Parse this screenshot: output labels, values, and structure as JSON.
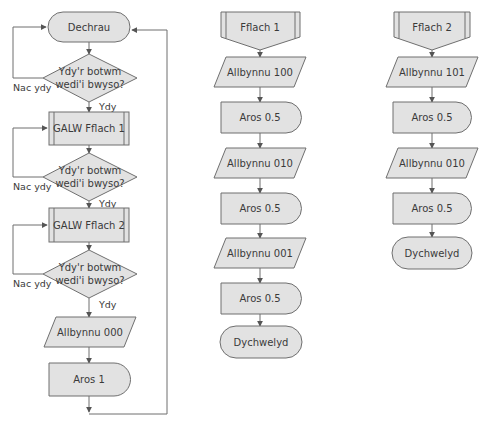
{
  "diagram": {
    "type": "flowchart",
    "colors": {
      "fill": "#e2e2e2",
      "stroke": "#6f6f6f",
      "text": "#3a3a3a"
    },
    "main": {
      "start": "Dechrau",
      "decision1": {
        "line1": "Ydy'r botwm",
        "line2": "wedi'i bwyso?",
        "yes": "Ydy",
        "no": "Nac ydy"
      },
      "call1": "GALW Fflach 1",
      "decision2": {
        "line1": "Ydy'r botwm",
        "line2": "wedi'i bwyso?",
        "yes": "Ydy",
        "no": "Nac ydy"
      },
      "call2": "GALW Fflach 2",
      "decision3": {
        "line1": "Ydy'r botwm",
        "line2": "wedi'i bwyso?",
        "yes": "Ydy",
        "no": "Nac ydy"
      },
      "output": "Allbynnu 000",
      "delay": "Aros 1"
    },
    "flach1": {
      "title": "Fflach 1",
      "steps": [
        "Allbynnu 100",
        "Aros 0.5",
        "Allbynnu 010",
        "Aros 0.5",
        "Allbynnu 001",
        "Aros 0.5"
      ],
      "end": "Dychwelyd"
    },
    "flach2": {
      "title": "Fflach 2",
      "steps": [
        "Allbynnu 101",
        "Aros 0.5",
        "Allbynnu 010",
        "Aros 0.5"
      ],
      "end": "Dychwelyd"
    }
  }
}
